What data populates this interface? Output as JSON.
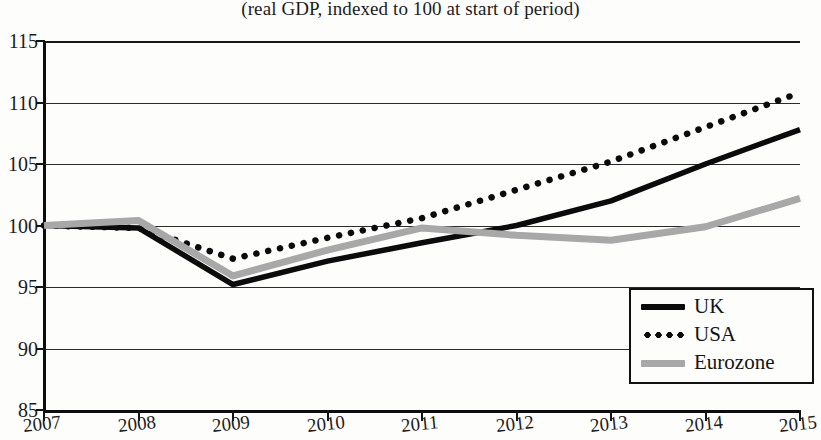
{
  "chart_data": {
    "type": "line",
    "title": "",
    "subtitle": "(real GDP, indexed to 100 at start of period)",
    "xlabel": "",
    "ylabel": "",
    "x": [
      2007,
      2008,
      2009,
      2010,
      2011,
      2012,
      2013,
      2014,
      2015
    ],
    "categories": [
      "2007",
      "2008",
      "2009",
      "2010",
      "2011",
      "2012",
      "2013",
      "2014",
      "2015"
    ],
    "ylim": [
      85,
      115
    ],
    "yticks": [
      85,
      90,
      95,
      100,
      105,
      110,
      115
    ],
    "ytick_labels": [
      "85",
      "90",
      "95",
      "100",
      "105",
      "110",
      "115"
    ],
    "xlim": [
      2007,
      2015
    ],
    "grid": "horizontal",
    "legend_position": "bottom-right",
    "series": [
      {
        "name": "UK",
        "style": "solid",
        "color": "#0b0b0b",
        "values": [
          100.0,
          99.8,
          95.2,
          97.1,
          98.6,
          100.0,
          102.0,
          105.0,
          107.8
        ]
      },
      {
        "name": "USA",
        "style": "dotted",
        "color": "#0b0b0b",
        "values": [
          100.0,
          99.8,
          97.3,
          99.0,
          100.6,
          102.9,
          105.2,
          108.0,
          110.8
        ]
      },
      {
        "name": "Eurozone",
        "style": "solid",
        "color": "#a8a8a8",
        "values": [
          100.0,
          100.4,
          95.9,
          98.0,
          99.8,
          99.2,
          98.8,
          99.9,
          102.2
        ]
      }
    ]
  },
  "legend": {
    "items": [
      {
        "label": "UK",
        "swatch": "solid-black-line"
      },
      {
        "label": "USA",
        "swatch": "dotted-black-line"
      },
      {
        "label": "Eurozone",
        "swatch": "solid-gray-line"
      }
    ]
  },
  "ghost_title_fragment": "g"
}
